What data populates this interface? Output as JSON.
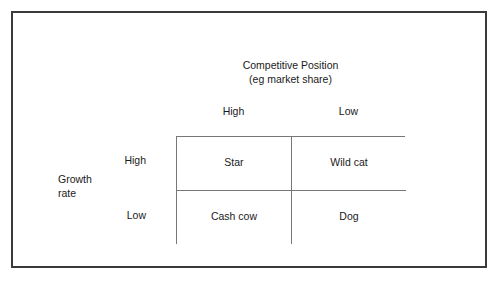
{
  "figure": {
    "name": "bcg-growth-share-matrix"
  },
  "column_axis": {
    "title_line1": "Competitive Position",
    "title_line2": "(eg market share)",
    "headers": [
      {
        "label": "High"
      },
      {
        "label": "Low"
      }
    ]
  },
  "row_axis": {
    "title_line1": "Growth",
    "title_line2": "rate",
    "headers": [
      {
        "label": "High"
      },
      {
        "label": "Low"
      }
    ]
  },
  "matrix": {
    "cells": [
      {
        "label": "Star"
      },
      {
        "label": "Wild cat"
      },
      {
        "label": "Cash cow"
      },
      {
        "label": "Dog"
      }
    ]
  },
  "colors": {
    "frame_border": "#3a3a3a",
    "grid_line": "#777777",
    "text": "#1a1a1a",
    "background": "#ffffff"
  }
}
